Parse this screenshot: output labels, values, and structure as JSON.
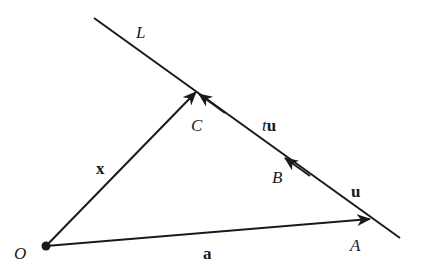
{
  "diagram": {
    "type": "vector-line-diagram",
    "colors": {
      "ink": "#1a1a1a",
      "background": "#ffffff"
    },
    "points": {
      "O": {
        "label": "O",
        "x": 46,
        "y": 246
      },
      "A": {
        "label": "A",
        "x": 370,
        "y": 219
      },
      "B": {
        "label": "B",
        "x": 285,
        "y": 158
      },
      "C": {
        "label": "C",
        "x": 196,
        "y": 92
      }
    },
    "line": {
      "label": "L",
      "x1": 94,
      "y1": 18,
      "x2": 400,
      "y2": 238
    },
    "vectors": {
      "a": {
        "label": "a",
        "from": "O",
        "to": "A"
      },
      "x": {
        "label": "x",
        "from": "O",
        "to": "C"
      },
      "u": {
        "label": "u",
        "from": "A",
        "to": "B"
      },
      "tu": {
        "label_t": "t",
        "label_u": "u",
        "from": "A",
        "to": "C"
      }
    }
  }
}
